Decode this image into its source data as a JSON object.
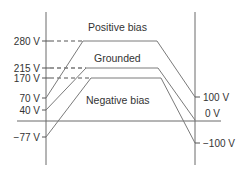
{
  "colors": {
    "axis": "#6b6b6b",
    "curve": "#7a7a7a",
    "dash": "#444444",
    "text": "#333333"
  },
  "left_axis": {
    "ticks": [
      {
        "label": "280 V",
        "y": 41
      },
      {
        "label": "215 V",
        "y": 68
      },
      {
        "label": "170 V",
        "y": 78
      },
      {
        "label": "70 V",
        "y": 98
      },
      {
        "label": "40 V",
        "y": 110
      },
      {
        "label": "−77 V",
        "y": 137
      }
    ]
  },
  "right_axis": {
    "ticks": [
      {
        "label": "100 V",
        "y": 97
      },
      {
        "label": "0 V",
        "y": 120
      },
      {
        "label": "−100 V",
        "y": 143
      }
    ]
  },
  "curves": [
    {
      "name": "Positive bias",
      "label": "Positive bias",
      "start_v": "70 V",
      "plateau_v": "280 V",
      "end_v": "100 V",
      "points": [
        [
          46,
          98
        ],
        [
          83,
          41
        ],
        [
          157,
          41
        ],
        [
          195,
          97
        ]
      ],
      "label_pos": [
        88,
        30
      ]
    },
    {
      "name": "Grounded",
      "label": "Grounded",
      "start_v": "40 V",
      "plateau_v": "215 V",
      "end_v": "0 V",
      "points": [
        [
          46,
          110
        ],
        [
          86,
          68
        ],
        [
          158,
          68
        ],
        [
          195,
          120
        ]
      ],
      "label_pos": [
        94,
        59
      ]
    },
    {
      "name": "Negative bias",
      "label": "Negative bias",
      "start_v": "−77 V",
      "plateau_v": "170 V",
      "end_v": "−100 V",
      "points": [
        [
          46,
          137
        ],
        [
          91,
          78
        ],
        [
          161,
          78
        ],
        [
          195,
          143
        ]
      ],
      "label_pos": [
        86,
        103
      ]
    }
  ]
}
